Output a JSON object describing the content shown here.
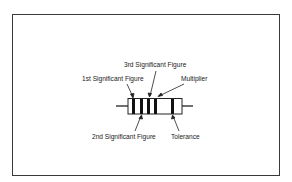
{
  "diagram": {
    "type": "resistor-color-code",
    "labels": {
      "first_significant": "1st Significant Figure",
      "second_significant": "2nd Significant Figure",
      "third_significant": "3rd Significant Figure",
      "multiplier": "Multiplier",
      "tolerance": "Tolerance"
    },
    "bands": [
      "1st Significant Figure",
      "2nd Significant Figure",
      "3rd Significant Figure",
      "Multiplier",
      "Tolerance"
    ],
    "colors": {
      "stroke": "#222222",
      "background": "#ffffff",
      "frame": "#3a3a3a"
    }
  }
}
